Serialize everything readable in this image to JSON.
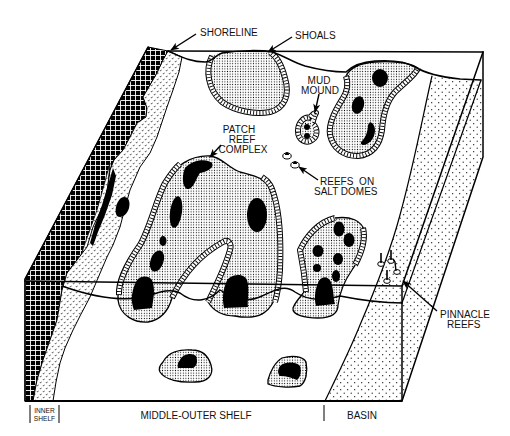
{
  "diagram": {
    "type": "carbonate-platform-block-diagram",
    "labels": {
      "shoreline": "SHORELINE",
      "shoals": "SHOALS",
      "mud_mound": [
        "MUD",
        "MOUND"
      ],
      "patch_reef_complex": [
        "PATCH",
        "REEF",
        "COMPLEX"
      ],
      "reefs_on_salt_domes": [
        "REEFS ON",
        "SALT DOMES"
      ],
      "pinnacle_reefs": [
        "PINNACLE",
        "REEFS"
      ]
    },
    "zones": {
      "inner_shelf": [
        "INNER",
        "SHELF"
      ],
      "middle_outer_shelf": "MIDDLE-OUTER SHELF",
      "basin": "BASIN"
    },
    "colors": {
      "ink": "#000000",
      "paper": "#ffffff"
    }
  }
}
